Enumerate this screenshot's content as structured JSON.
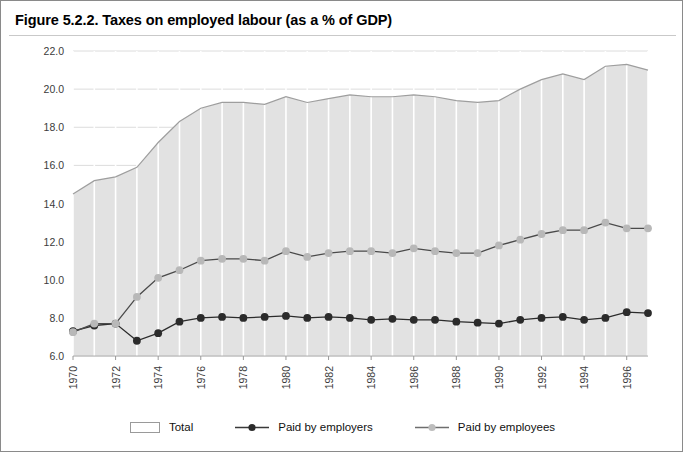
{
  "figure": {
    "title": "Figure 5.2.2. Taxes on employed labour (as a % of GDP)"
  },
  "legend": {
    "items": [
      {
        "label": "Total",
        "marker": "area-swatch",
        "color": "#e0e0e0"
      },
      {
        "label": "Paid by employers",
        "marker": "line-marker-dark",
        "color": "#2b2b2b"
      },
      {
        "label": "Paid by employees",
        "marker": "line-marker-gray",
        "color": "#b5b5b5"
      }
    ]
  },
  "chart_data": {
    "type": "area",
    "title": "Taxes on employed labour (as a % of GDP)",
    "xlabel": "",
    "ylabel": "",
    "xlim": [
      1970,
      1997
    ],
    "ylim": [
      6.0,
      22.0
    ],
    "yticks": [
      "6.0",
      "8.0",
      "10.0",
      "12.0",
      "14.0",
      "16.0",
      "18.0",
      "20.0",
      "22.0"
    ],
    "ytick_values": [
      6.0,
      8.0,
      10.0,
      12.0,
      14.0,
      16.0,
      18.0,
      20.0,
      22.0
    ],
    "xticks": [
      "1970",
      "1972",
      "1974",
      "1976",
      "1978",
      "1980",
      "1982",
      "1984",
      "1986",
      "1988",
      "1990",
      "1992",
      "1994",
      "1996"
    ],
    "xtick_values": [
      1970,
      1972,
      1974,
      1976,
      1978,
      1980,
      1982,
      1984,
      1986,
      1988,
      1990,
      1992,
      1994,
      1996
    ],
    "x": [
      1970,
      1971,
      1972,
      1973,
      1974,
      1975,
      1976,
      1977,
      1978,
      1979,
      1980,
      1981,
      1982,
      1983,
      1984,
      1985,
      1986,
      1987,
      1988,
      1989,
      1990,
      1991,
      1992,
      1993,
      1994,
      1995,
      1996,
      1997
    ],
    "grid": true,
    "legend_position": "bottom",
    "series": [
      {
        "name": "Total",
        "style": "area",
        "color": "#e2e2e2",
        "line_color": "#9e9e9e",
        "values": [
          14.5,
          15.2,
          15.4,
          15.9,
          17.2,
          18.3,
          19.0,
          19.3,
          19.3,
          19.2,
          19.6,
          19.3,
          19.5,
          19.7,
          19.6,
          19.6,
          19.7,
          19.6,
          19.4,
          19.3,
          19.4,
          20.0,
          20.5,
          20.8,
          20.5,
          21.2,
          21.3,
          21.0
        ]
      },
      {
        "name": "Paid by employers",
        "style": "line-marker",
        "color": "#2b2b2b",
        "marker_color": "#2b2b2b",
        "values": [
          7.3,
          7.6,
          7.7,
          6.8,
          7.2,
          7.8,
          8.0,
          8.05,
          8.0,
          8.05,
          8.1,
          8.0,
          8.05,
          8.0,
          7.9,
          7.95,
          7.9,
          7.9,
          7.8,
          7.75,
          7.7,
          7.9,
          8.0,
          8.05,
          7.9,
          8.0,
          8.3,
          8.25
        ]
      },
      {
        "name": "Paid by employees",
        "style": "line-marker",
        "color": "#b5b5b5",
        "marker_color": "#b8b8b8",
        "line_color": "#4a4a4a",
        "values": [
          7.25,
          7.7,
          7.7,
          9.1,
          10.1,
          10.5,
          11.0,
          11.1,
          11.1,
          11.0,
          11.5,
          11.2,
          11.4,
          11.5,
          11.5,
          11.4,
          11.65,
          11.5,
          11.4,
          11.4,
          11.8,
          12.1,
          12.4,
          12.6,
          12.6,
          13.0,
          12.7,
          12.7
        ]
      }
    ]
  }
}
